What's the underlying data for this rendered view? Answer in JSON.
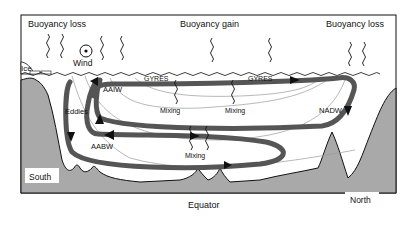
{
  "diagram": {
    "type": "ocean overturning circulation schematic",
    "top_labels": {
      "buoyancy_loss_left": "Buoyancy loss",
      "buoyancy_gain": "Buoyancy gain",
      "buoyancy_loss_right": "Buoyancy loss",
      "wind": "Wind",
      "ice": "Ice"
    },
    "water_masses": {
      "aaiw": "AAIW",
      "aabw": "AABW",
      "nadw": "NADW"
    },
    "processes": {
      "gyres_left": "GYRES",
      "gyres_right": "GYRES",
      "eddies": "Eddies",
      "mixing_1": "Mixing",
      "mixing_2": "Mixing",
      "mixing_3": "Mixing"
    },
    "locations": {
      "south": "South",
      "equator": "Equator",
      "north": "North"
    },
    "colors": {
      "land": "#a8a8a8",
      "circulation_arrow": "#555555",
      "outline": "#111111",
      "isopycnal": "#999999"
    }
  }
}
